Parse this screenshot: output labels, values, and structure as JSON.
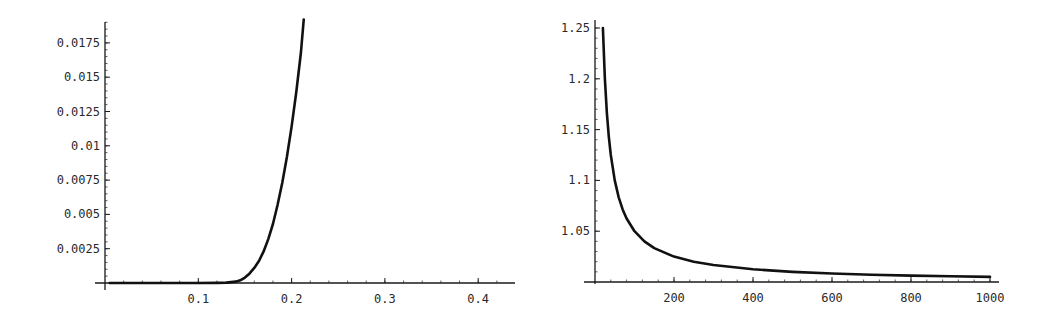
{
  "chart_data": [
    {
      "type": "line",
      "title": "",
      "xlabel": "",
      "ylabel": "",
      "xlim": [
        0,
        0.44
      ],
      "ylim": [
        0,
        0.0192
      ],
      "grid": false,
      "legend": "none",
      "x_ticks": [
        0.1,
        0.2,
        0.3,
        0.4
      ],
      "x_tick_labels": [
        "0.1",
        "0.2",
        "0.3",
        "0.4"
      ],
      "y_ticks": [
        0.0025,
        0.005,
        0.0075,
        0.01,
        0.0125,
        0.015,
        0.0175
      ],
      "y_tick_labels": [
        "0.0025",
        "0.005",
        "0.0075",
        "0.01",
        "0.0125",
        "0.015",
        "0.0175"
      ],
      "series": [
        {
          "name": "curve",
          "x": [
            0.005,
            0.05,
            0.1,
            0.12,
            0.13,
            0.14,
            0.145,
            0.15,
            0.155,
            0.16,
            0.165,
            0.17,
            0.175,
            0.18,
            0.185,
            0.19,
            0.195,
            0.2,
            0.205,
            0.21,
            0.213
          ],
          "y": [
            0,
            0,
            0,
            1e-05,
            3e-05,
            0.0001,
            0.0002,
            0.0004,
            0.0007,
            0.0011,
            0.0016,
            0.0023,
            0.0032,
            0.0043,
            0.0057,
            0.0073,
            0.0092,
            0.0114,
            0.0139,
            0.0168,
            0.0192
          ]
        }
      ]
    },
    {
      "type": "line",
      "title": "",
      "xlabel": "",
      "ylabel": "",
      "xlim": [
        0,
        1000
      ],
      "ylim": [
        1.0,
        1.26
      ],
      "grid": false,
      "legend": "none",
      "x_ticks": [
        200,
        400,
        600,
        800,
        1000
      ],
      "x_tick_labels": [
        "200",
        "400",
        "600",
        "800",
        "1000"
      ],
      "y_ticks": [
        1.05,
        1.1,
        1.15,
        1.2,
        1.25
      ],
      "y_tick_labels": [
        "1.05",
        "1.1",
        "1.15",
        "1.2",
        "1.25"
      ],
      "series": [
        {
          "name": "curve",
          "x": [
            20,
            25,
            30,
            35,
            40,
            50,
            60,
            70,
            80,
            100,
            125,
            150,
            200,
            250,
            300,
            400,
            500,
            600,
            700,
            800,
            900,
            1000
          ],
          "y": [
            1.25,
            1.2,
            1.1667,
            1.1429,
            1.125,
            1.1,
            1.0833,
            1.0714,
            1.0625,
            1.05,
            1.04,
            1.0333,
            1.025,
            1.02,
            1.0167,
            1.0125,
            1.01,
            1.0083,
            1.0071,
            1.0063,
            1.0056,
            1.005
          ]
        }
      ]
    }
  ]
}
